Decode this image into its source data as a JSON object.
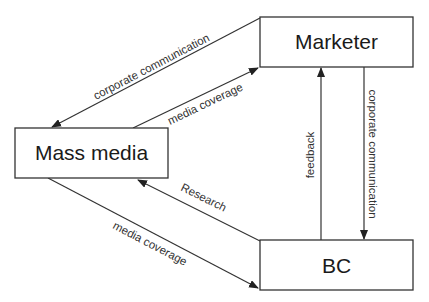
{
  "diagram": {
    "nodes": [
      {
        "id": "marketer",
        "label": "Marketer"
      },
      {
        "id": "mass_media",
        "label": "Mass media"
      },
      {
        "id": "bc",
        "label": "BC"
      }
    ],
    "edges": [
      {
        "from": "marketer",
        "to": "mass_media",
        "label": "corporate communication"
      },
      {
        "from": "mass_media",
        "to": "marketer",
        "label": "media coverage"
      },
      {
        "from": "bc",
        "to": "marketer",
        "label": "feedback"
      },
      {
        "from": "marketer",
        "to": "bc",
        "label": "corporate communication"
      },
      {
        "from": "bc",
        "to": "mass_media",
        "label": "Research"
      },
      {
        "from": "mass_media",
        "to": "bc",
        "label": "media coverage"
      }
    ],
    "colors": {
      "stroke": "#333333",
      "text": "#1a1a1a",
      "background": "#ffffff"
    }
  }
}
